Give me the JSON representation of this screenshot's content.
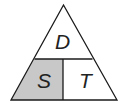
{
  "diagram": {
    "type": "formula-triangle",
    "top_label": "D",
    "bottom_left_label": "S",
    "bottom_right_label": "T",
    "colors": {
      "stroke": "#1a1a1a",
      "shaded_fill": "#c8c8c8",
      "background": "#ffffff"
    }
  }
}
